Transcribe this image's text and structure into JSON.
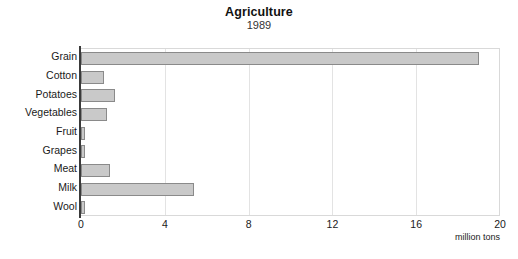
{
  "chart_data": {
    "type": "bar",
    "orientation": "horizontal",
    "title": "Agriculture",
    "subtitle": "1989",
    "xlabel": "million tons",
    "ylabel": "",
    "categories": [
      "Grain",
      "Cotton",
      "Potatoes",
      "Vegetables",
      "Fruit",
      "Grapes",
      "Meat",
      "Milk",
      "Wool"
    ],
    "values": [
      19.0,
      1.1,
      1.6,
      1.25,
      0.2,
      0.2,
      1.4,
      5.4,
      0.2
    ],
    "xlim": [
      0,
      20
    ],
    "xticks": [
      0,
      4,
      8,
      12,
      16,
      20
    ],
    "xtick_labels": [
      "0",
      "4",
      "8",
      "12",
      "16",
      "20"
    ],
    "grid": "vertical",
    "legend": "none",
    "bar_fill_color": "#c9c9c9",
    "bar_edge_color": "#8a8a8a",
    "axis_color": "#3a3a3a",
    "gridline_color": "#e3e3e3",
    "frame_color": "#d9d9d9",
    "background_color": "#ffffff"
  }
}
